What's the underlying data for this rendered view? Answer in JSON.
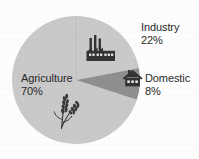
{
  "figure": {
    "background_color": "#fdfdfd",
    "text_color": "#2a2a2a"
  },
  "chart_data": {
    "type": "pie",
    "title": "",
    "subtitle": "",
    "xlabel": "",
    "ylabel": "",
    "legend_position": "none",
    "grid": false,
    "units": "percent",
    "center": {
      "x": 76,
      "y": 80
    },
    "radius": 64,
    "start_angle_deg": 0,
    "direction": "clockwise",
    "categories": [
      "Industry",
      "Domestic",
      "Agriculture"
    ],
    "values": [
      22,
      8,
      70
    ],
    "slices": [
      {
        "name": "Industry",
        "label": "Industry",
        "value": 22,
        "value_label": "22%",
        "color": "#c9c9c9",
        "icon": "factory-icon",
        "label_placement": "outside-right"
      },
      {
        "name": "Domestic",
        "label": "Domestic",
        "value": 8,
        "value_label": "8%",
        "color": "#8f8f8f",
        "icon": "house-icon",
        "label_placement": "outside-right"
      },
      {
        "name": "Agriculture",
        "label": "Agriculture",
        "value": 70,
        "value_label": "70%",
        "color": "#c9c9c9",
        "icon": "wheat-icon",
        "label_placement": "inside-left"
      }
    ]
  },
  "labels": {
    "industry": {
      "name": "Industry",
      "percent": "22%"
    },
    "domestic": {
      "name": "Domestic",
      "percent": "8%"
    },
    "agriculture": {
      "name": "Agriculture",
      "percent": "70%"
    }
  },
  "colors": {
    "slice_light": "#c9c9c9",
    "slice_dark": "#8f8f8f",
    "icon": "#333333",
    "divider": "#b4b4b4",
    "text": "#2a2a2a"
  }
}
